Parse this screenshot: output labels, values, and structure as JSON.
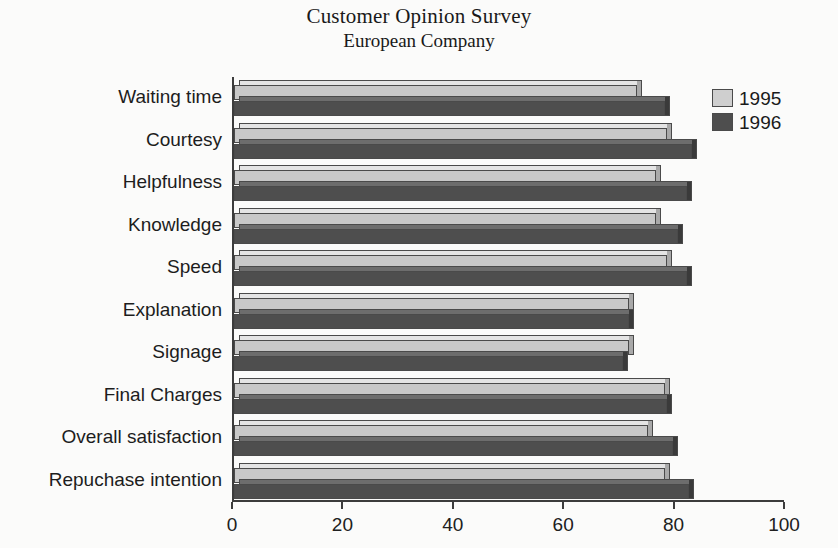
{
  "chart_data": {
    "type": "bar",
    "orientation": "horizontal",
    "title": "Customer Opinion Survey",
    "subtitle": "European Company",
    "xlabel": "",
    "ylabel": "",
    "xlim": [
      0,
      100
    ],
    "xticks": [
      0,
      20,
      40,
      60,
      80,
      100
    ],
    "grid": false,
    "legend_position": "top-right",
    "categories": [
      "Waiting time",
      "Courtesy",
      "Helpfulness",
      "Knowledge",
      "Speed",
      "Explanation",
      "Signage",
      "Final Charges",
      "Overall satisfaction",
      "Repuchase intention"
    ],
    "series": [
      {
        "name": "1995",
        "color": "#c8c8c8",
        "values": [
          73,
          78.5,
          76.5,
          76.5,
          78.5,
          71.5,
          71.5,
          78,
          75,
          78
        ]
      },
      {
        "name": "1996",
        "color": "#4e4e4e",
        "values": [
          78,
          83,
          82,
          80.5,
          82,
          71.5,
          70.5,
          78.5,
          79.5,
          82.5
        ]
      }
    ]
  },
  "legend": {
    "entries": [
      {
        "label": "1995",
        "swatch": "y1995"
      },
      {
        "label": "1996",
        "swatch": "y1996"
      }
    ]
  },
  "axis": {
    "tick_labels": [
      "0",
      "20",
      "40",
      "60",
      "80",
      "100"
    ]
  }
}
